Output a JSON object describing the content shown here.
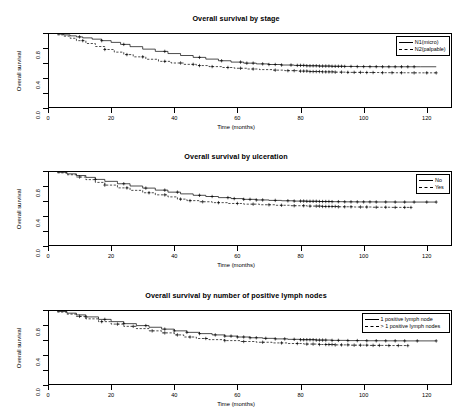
{
  "figure": {
    "background": "#ffffff",
    "line_color": "#000000",
    "axis_title_x": "Time (months)",
    "axis_title_y": "Overall survival"
  },
  "chart_data": [
    {
      "type": "line",
      "title": "Overall survival by stage",
      "xlabel": "Time (months)",
      "ylabel": "Overall survival",
      "xlim": [
        0,
        128
      ],
      "ylim": [
        0,
        1.0
      ],
      "xticks": [
        0,
        20,
        40,
        60,
        80,
        100,
        120
      ],
      "yticks": [
        0.0,
        0.4,
        0.8
      ],
      "yticks_minor": [
        0.2,
        0.6,
        1.0
      ],
      "grid": false,
      "legend_position": "top-right-inside",
      "series": [
        {
          "name": "N1(micro)",
          "style": "solid",
          "x": [
            0,
            3,
            5,
            7,
            9,
            11,
            14,
            17,
            20,
            23,
            26,
            30,
            34,
            38,
            42,
            46,
            50,
            54,
            58,
            62,
            66,
            70,
            74,
            78,
            82,
            86,
            90,
            94,
            98,
            102,
            106,
            110,
            114,
            118,
            123
          ],
          "y": [
            1.0,
            0.985,
            0.975,
            0.962,
            0.948,
            0.935,
            0.918,
            0.898,
            0.875,
            0.848,
            0.818,
            0.785,
            0.755,
            0.726,
            0.7,
            0.675,
            0.652,
            0.63,
            0.612,
            0.598,
            0.588,
            0.58,
            0.573,
            0.568,
            0.563,
            0.559,
            0.556,
            0.554,
            0.552,
            0.551,
            0.55,
            0.55,
            0.55,
            0.55,
            0.55
          ],
          "censor_x": [
            10,
            17,
            24,
            37,
            48,
            55,
            61,
            63,
            65,
            68,
            70,
            72,
            74,
            77,
            79,
            80,
            81,
            82,
            83,
            84,
            85,
            86,
            87,
            88,
            89,
            90,
            91,
            92,
            93,
            94,
            96,
            98,
            100,
            102,
            104,
            106,
            108,
            110,
            112,
            114,
            116
          ]
        },
        {
          "name": "N2(palpable)",
          "style": "dashed",
          "x": [
            0,
            3,
            5,
            7,
            9,
            12,
            15,
            18,
            21,
            24,
            27,
            31,
            35,
            39,
            43,
            47,
            51,
            55,
            59,
            63,
            67,
            71,
            75,
            79,
            83,
            87,
            91,
            95,
            100,
            105,
            110,
            115,
            120,
            123
          ],
          "y": [
            1.0,
            0.975,
            0.958,
            0.93,
            0.898,
            0.86,
            0.82,
            0.78,
            0.745,
            0.712,
            0.682,
            0.65,
            0.622,
            0.6,
            0.582,
            0.566,
            0.552,
            0.54,
            0.53,
            0.52,
            0.512,
            0.505,
            0.498,
            0.492,
            0.486,
            0.482,
            0.478,
            0.475,
            0.473,
            0.471,
            0.47,
            0.469,
            0.469,
            0.469
          ],
          "censor_x": [
            11,
            18,
            25,
            30,
            37,
            42,
            46,
            48,
            52,
            57,
            61,
            65,
            72,
            76,
            78,
            80,
            81,
            82,
            83,
            84,
            85,
            86,
            87,
            88,
            89,
            90,
            91,
            93,
            95,
            97,
            99,
            101,
            103,
            106,
            109,
            112,
            116,
            120,
            123
          ]
        }
      ]
    },
    {
      "type": "line",
      "title": "Overall survival by ulceration",
      "xlabel": "Time (months)",
      "ylabel": "Overall survival",
      "xlim": [
        0,
        128
      ],
      "ylim": [
        0,
        1.0
      ],
      "xticks": [
        0,
        20,
        40,
        60,
        80,
        100,
        120
      ],
      "yticks": [
        0.0,
        0.4,
        0.8
      ],
      "yticks_minor": [
        0.2,
        0.6,
        1.0
      ],
      "grid": false,
      "legend_position": "top-right-inside",
      "series": [
        {
          "name": "No",
          "style": "solid",
          "x": [
            0,
            3,
            6,
            9,
            12,
            15,
            18,
            22,
            26,
            30,
            34,
            38,
            42,
            46,
            50,
            54,
            58,
            62,
            66,
            70,
            74,
            78,
            82,
            86,
            90,
            94,
            98,
            104,
            110,
            116,
            123
          ],
          "y": [
            1.0,
            0.982,
            0.962,
            0.94,
            0.915,
            0.888,
            0.862,
            0.83,
            0.8,
            0.772,
            0.745,
            0.718,
            0.695,
            0.676,
            0.66,
            0.645,
            0.632,
            0.622,
            0.614,
            0.608,
            0.603,
            0.599,
            0.596,
            0.593,
            0.591,
            0.589,
            0.588,
            0.587,
            0.586,
            0.586,
            0.586
          ],
          "censor_x": [
            15,
            24,
            31,
            37,
            41,
            48,
            52,
            57,
            59,
            62,
            64,
            66,
            68,
            72,
            76,
            78,
            80,
            81,
            82,
            83,
            84,
            85,
            86,
            87,
            88,
            89,
            90,
            92,
            94,
            96,
            98,
            100,
            102,
            104,
            107,
            110,
            113,
            116,
            120,
            123
          ]
        },
        {
          "name": "Yes",
          "style": "dashed",
          "x": [
            0,
            3,
            6,
            9,
            12,
            15,
            18,
            22,
            26,
            30,
            34,
            38,
            41,
            44,
            48,
            52,
            57,
            62,
            67,
            72,
            77,
            82,
            87,
            92,
            97,
            103,
            109,
            115
          ],
          "y": [
            1.0,
            0.975,
            0.95,
            0.92,
            0.885,
            0.848,
            0.812,
            0.775,
            0.742,
            0.71,
            0.682,
            0.655,
            0.625,
            0.605,
            0.59,
            0.578,
            0.567,
            0.558,
            0.55,
            0.543,
            0.537,
            0.532,
            0.527,
            0.523,
            0.52,
            0.517,
            0.515,
            0.514
          ],
          "censor_x": [
            10,
            18,
            25,
            32,
            37,
            42,
            45,
            49,
            54,
            60,
            65,
            70,
            74,
            78,
            81,
            83,
            85,
            86,
            87,
            88,
            89,
            90,
            91,
            92,
            94,
            96,
            99,
            101,
            104,
            107,
            110,
            113,
            115
          ]
        }
      ]
    },
    {
      "type": "line",
      "title": "Overall survival by number of positive lymph nodes",
      "xlabel": "Time (months)",
      "ylabel": "Overall survival",
      "xlim": [
        0,
        128
      ],
      "ylim": [
        0,
        1.0
      ],
      "xticks": [
        0,
        20,
        40,
        60,
        80,
        100,
        120
      ],
      "yticks": [
        0.0,
        0.4,
        0.8
      ],
      "yticks_minor": [
        0.2,
        0.6,
        1.0
      ],
      "grid": false,
      "legend_position": "top-right-inside",
      "series": [
        {
          "name": "1 positive lymph node",
          "style": "solid",
          "x": [
            0,
            3,
            6,
            9,
            12,
            16,
            20,
            24,
            28,
            32,
            36,
            40,
            44,
            48,
            52,
            56,
            60,
            64,
            68,
            72,
            76,
            80,
            85,
            90,
            95,
            101,
            107,
            113,
            123
          ],
          "y": [
            1.0,
            0.98,
            0.958,
            0.935,
            0.908,
            0.875,
            0.845,
            0.818,
            0.792,
            0.77,
            0.745,
            0.722,
            0.702,
            0.685,
            0.668,
            0.652,
            0.64,
            0.63,
            0.622,
            0.615,
            0.609,
            0.604,
            0.599,
            0.595,
            0.592,
            0.59,
            0.589,
            0.588,
            0.588
          ],
          "censor_x": [
            12,
            18,
            24,
            31,
            37,
            40,
            44,
            48,
            53,
            56,
            58,
            60,
            62,
            64,
            66,
            69,
            72,
            75,
            78,
            80,
            81,
            82,
            83,
            84,
            85,
            86,
            87,
            88,
            90,
            92,
            95,
            98,
            101,
            104,
            107,
            110,
            113,
            117,
            123
          ]
        },
        {
          "name": "> 1 positive lymph nodes",
          "style": "dashed",
          "x": [
            0,
            3,
            6,
            9,
            12,
            16,
            20,
            24,
            28,
            32,
            36,
            40,
            43,
            47,
            51,
            56,
            61,
            66,
            71,
            76,
            81,
            86,
            91,
            96,
            102,
            108,
            114
          ],
          "y": [
            1.0,
            0.972,
            0.945,
            0.915,
            0.882,
            0.845,
            0.812,
            0.782,
            0.752,
            0.722,
            0.695,
            0.668,
            0.64,
            0.62,
            0.605,
            0.592,
            0.58,
            0.57,
            0.561,
            0.553,
            0.546,
            0.54,
            0.535,
            0.531,
            0.528,
            0.526,
            0.525
          ],
          "censor_x": [
            10,
            17,
            22,
            27,
            33,
            37,
            41,
            45,
            50,
            56,
            62,
            68,
            74,
            79,
            82,
            84,
            86,
            88,
            89,
            90,
            91,
            93,
            95,
            97,
            99,
            101,
            103,
            105,
            108,
            111,
            114
          ]
        }
      ]
    }
  ]
}
